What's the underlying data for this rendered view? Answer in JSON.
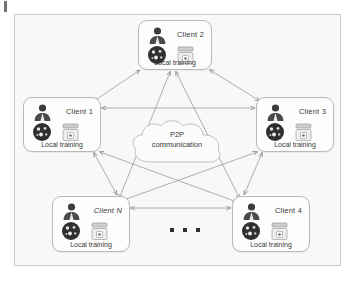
{
  "figure": {
    "background_color": "#f8f8f8",
    "frame_color": "#c9c9c9",
    "line_color": "#9a9a9a"
  },
  "cloud": {
    "line1": "P2P",
    "line2": "communication",
    "name": "p2p-communication-cloud"
  },
  "caption_text": "Local training",
  "ellipsis": {
    "dot_count": 3,
    "meaning": "more clients"
  },
  "nodes": [
    {
      "id": "client-2",
      "title": "Client 2",
      "caption": "Local training",
      "italic": false,
      "x": 138,
      "y": 20,
      "w": 74,
      "h": 50
    },
    {
      "id": "client-1",
      "title": "Client 1",
      "caption": "Local training",
      "italic": false,
      "x": 23,
      "y": 97,
      "w": 78,
      "h": 55
    },
    {
      "id": "client-3",
      "title": "Client 3",
      "caption": "Local training",
      "italic": false,
      "x": 256,
      "y": 97,
      "w": 78,
      "h": 55
    },
    {
      "id": "client-n",
      "title": "Client N",
      "caption": "Local training",
      "italic": true,
      "x": 52,
      "y": 196,
      "w": 78,
      "h": 56
    },
    {
      "id": "client-4",
      "title": "Client 4",
      "caption": "Local training",
      "italic": false,
      "x": 232,
      "y": 196,
      "w": 78,
      "h": 56
    }
  ],
  "icons": {
    "person": "person-avatar-icon",
    "data": "data-circle-icon",
    "server": "server-stack-icon"
  },
  "connections": [
    {
      "from": "client-1",
      "to": "client-2",
      "type": "double-arrow"
    },
    {
      "from": "client-2",
      "to": "client-3",
      "type": "double-arrow"
    },
    {
      "from": "client-1",
      "to": "client-3",
      "type": "double-arrow"
    },
    {
      "from": "client-1",
      "to": "client-n",
      "type": "double-arrow"
    },
    {
      "from": "client-3",
      "to": "client-4",
      "type": "double-arrow"
    },
    {
      "from": "client-n",
      "to": "client-4",
      "type": "double-arrow"
    },
    {
      "from": "client-2",
      "to": "client-n",
      "type": "double-arrow"
    },
    {
      "from": "client-2",
      "to": "client-4",
      "type": "double-arrow"
    },
    {
      "from": "client-1",
      "to": "client-4",
      "type": "double-arrow"
    },
    {
      "from": "client-3",
      "to": "client-n",
      "type": "double-arrow"
    }
  ]
}
